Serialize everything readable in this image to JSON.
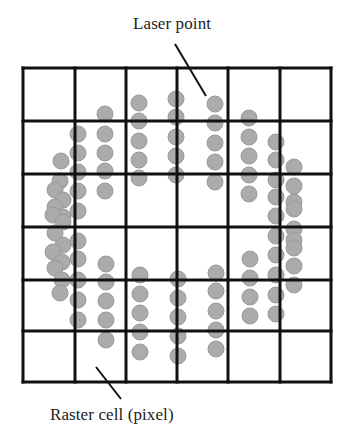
{
  "labels": {
    "laser_point": "Laser point",
    "raster_cell": "Raster cell (pixel)"
  },
  "colors": {
    "grid_line": "#111111",
    "dot_fill": "#ababab",
    "dot_stroke": "#9a9a9a",
    "leader_line": "#111111"
  },
  "grid": {
    "rows": 6,
    "cols": 6,
    "x_lines": [
      23,
      75,
      126,
      177,
      228,
      280,
      331
    ],
    "y_lines": [
      68,
      121,
      174,
      227,
      280,
      331,
      382
    ]
  },
  "leaders": [
    {
      "name": "laser-point-leader",
      "x1": 175,
      "y1": 44,
      "x2": 206,
      "y2": 96
    },
    {
      "name": "raster-cell-leader",
      "x1": 96,
      "y1": 367,
      "x2": 121,
      "y2": 399
    }
  ],
  "dot_radius": 8,
  "dots": [
    [
      78,
      134
    ],
    [
      78,
      153
    ],
    [
      78,
      172
    ],
    [
      78,
      191
    ],
    [
      78,
      211
    ],
    [
      61,
      161
    ],
    [
      60,
      181
    ],
    [
      55,
      190
    ],
    [
      63,
      200
    ],
    [
      55,
      207
    ],
    [
      63,
      217
    ],
    [
      53,
      215
    ],
    [
      63,
      222
    ],
    [
      55,
      233
    ],
    [
      63,
      245
    ],
    [
      53,
      252
    ],
    [
      62,
      262
    ],
    [
      55,
      268
    ],
    [
      62,
      280
    ],
    [
      60,
      293
    ],
    [
      78,
      241
    ],
    [
      78,
      259
    ],
    [
      78,
      280
    ],
    [
      78,
      300
    ],
    [
      78,
      320
    ],
    [
      105,
      114
    ],
    [
      105,
      134
    ],
    [
      105,
      153
    ],
    [
      105,
      171
    ],
    [
      105,
      191
    ],
    [
      139,
      103
    ],
    [
      139,
      121
    ],
    [
      139,
      141
    ],
    [
      139,
      160
    ],
    [
      139,
      178
    ],
    [
      176,
      99
    ],
    [
      176,
      117
    ],
    [
      176,
      137
    ],
    [
      176,
      156
    ],
    [
      176,
      175
    ],
    [
      215,
      104
    ],
    [
      215,
      123
    ],
    [
      215,
      143
    ],
    [
      215,
      162
    ],
    [
      215,
      182
    ],
    [
      249,
      118
    ],
    [
      249,
      137
    ],
    [
      249,
      156
    ],
    [
      249,
      175
    ],
    [
      249,
      194
    ],
    [
      276,
      142
    ],
    [
      276,
      160
    ],
    [
      276,
      180
    ],
    [
      276,
      197
    ],
    [
      276,
      216
    ],
    [
      276,
      236
    ],
    [
      276,
      255
    ],
    [
      276,
      275
    ],
    [
      276,
      295
    ],
    [
      276,
      314
    ],
    [
      294,
      167
    ],
    [
      294,
      186
    ],
    [
      294,
      202
    ],
    [
      294,
      209
    ],
    [
      294,
      229
    ],
    [
      294,
      240
    ],
    [
      294,
      248
    ],
    [
      294,
      266
    ],
    [
      294,
      285
    ],
    [
      250,
      259
    ],
    [
      250,
      278
    ],
    [
      250,
      297
    ],
    [
      250,
      316
    ],
    [
      106,
      264
    ],
    [
      106,
      282
    ],
    [
      106,
      301
    ],
    [
      106,
      320
    ],
    [
      106,
      340
    ],
    [
      140,
      275
    ],
    [
      140,
      294
    ],
    [
      140,
      313
    ],
    [
      140,
      332
    ],
    [
      140,
      352
    ],
    [
      178,
      279
    ],
    [
      178,
      298
    ],
    [
      178,
      317
    ],
    [
      178,
      336
    ],
    [
      178,
      356
    ],
    [
      216,
      273
    ],
    [
      216,
      291
    ],
    [
      216,
      311
    ],
    [
      216,
      330
    ],
    [
      216,
      349
    ]
  ]
}
